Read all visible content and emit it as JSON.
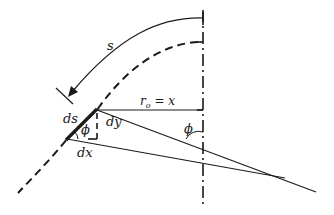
{
  "diagram": {
    "labels": {
      "arc_length": "s",
      "radius": "r",
      "radius_sub": "o",
      "radius_eq": " = x",
      "ds": "ds",
      "dy": "dy",
      "dx": "dx",
      "phi_small": "ϕ",
      "phi_axis": "ϕ"
    },
    "elements": [
      "axis-of-symmetry",
      "meridian-arc-arrow",
      "dashed-shell-curve",
      "ds-segment",
      "dx-dy-triangle",
      "normal-lines"
    ],
    "colors": {
      "stroke": "#1a1a1a",
      "background": "#ffffff"
    }
  }
}
